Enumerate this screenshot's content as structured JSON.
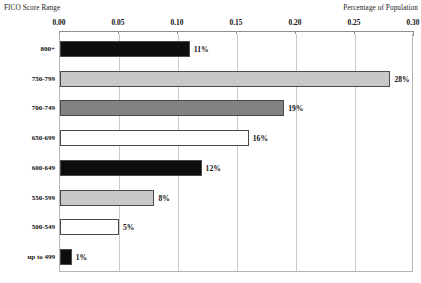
{
  "axis_titles": {
    "left": "FICO Score Range",
    "right": "Percentage of Population"
  },
  "captions": {
    "top": "",
    "bottom": ""
  },
  "chart_data": {
    "type": "bar",
    "orientation": "horizontal",
    "title": "",
    "xlabel": "Percentage of Population",
    "ylabel": "FICO Score Range",
    "xlim": [
      0,
      0.3
    ],
    "grid": true,
    "legend": "none",
    "xticks": [
      0,
      0.05,
      0.1,
      0.15,
      0.2,
      0.25,
      0.3
    ],
    "xtick_labels": [
      "0.00",
      "0.05",
      "0.10",
      "0.15",
      "0.20",
      "0.25",
      "0.30"
    ],
    "categories": [
      "800+",
      "750-799",
      "700-749",
      "650-699",
      "600-649",
      "550-599",
      "500-549",
      "up to 499"
    ],
    "values": [
      0.11,
      0.28,
      0.19,
      0.16,
      0.12,
      0.08,
      0.05,
      0.01
    ],
    "value_labels": [
      "11%",
      "28%",
      "19%",
      "16%",
      "12%",
      "8%",
      "5%",
      "1%"
    ],
    "bar_colors": [
      "#0d0d0d",
      "#c8c8c8",
      "#828282",
      "#ffffff",
      "#0d0d0d",
      "#c8c8c8",
      "#ffffff",
      "#0d0d0d"
    ],
    "bar_edge_color": "#4a4a4a"
  }
}
